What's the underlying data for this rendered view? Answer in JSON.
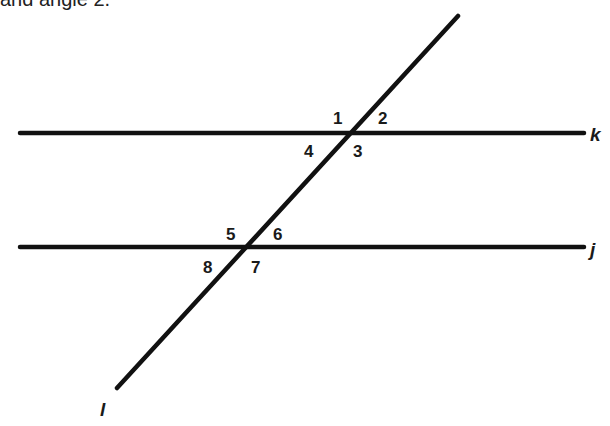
{
  "caption": "and angle 2.",
  "diagram": {
    "lines": [
      {
        "name": "k",
        "type": "parallel",
        "x1": 20,
        "y1": 133,
        "x2": 584,
        "y2": 133
      },
      {
        "name": "j",
        "type": "parallel",
        "x1": 20,
        "y1": 247,
        "x2": 584,
        "y2": 247
      },
      {
        "name": "l",
        "type": "transversal",
        "x1": 458,
        "y1": 16,
        "x2": 117,
        "y2": 388
      }
    ],
    "line_labels": {
      "k": "k",
      "j": "j",
      "l": "l"
    },
    "angles": [
      {
        "label": "1",
        "x": 333,
        "y": 124
      },
      {
        "label": "2",
        "x": 378,
        "y": 124
      },
      {
        "label": "3",
        "x": 353,
        "y": 157
      },
      {
        "label": "4",
        "x": 304,
        "y": 157
      },
      {
        "label": "5",
        "x": 226,
        "y": 240
      },
      {
        "label": "6",
        "x": 273,
        "y": 240
      },
      {
        "label": "7",
        "x": 251,
        "y": 273
      },
      {
        "label": "8",
        "x": 203,
        "y": 273
      }
    ],
    "stroke_color": "#111111"
  }
}
